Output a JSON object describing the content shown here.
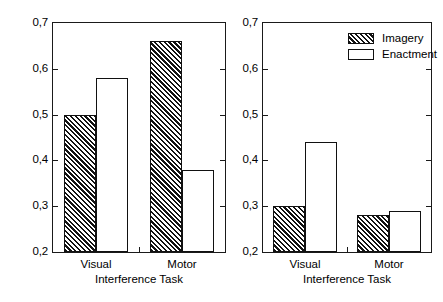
{
  "figure": {
    "panels": [
      {
        "id": "left",
        "ylabel": "Proportion of Recalled Items",
        "xlabel": "Interference Task",
        "show_ylabel": true
      },
      {
        "id": "right",
        "ylabel": "Proportion of Recalled Items",
        "xlabel": "Interference Task",
        "show_ylabel": false
      }
    ],
    "legend": {
      "position": "top-right-of-right-panel",
      "entries": [
        {
          "label": "Imagery",
          "fill": "hatched"
        },
        {
          "label": "Enactment",
          "fill": "white"
        }
      ]
    },
    "ytick_labels": [
      "0,2",
      "0,3",
      "0,4",
      "0,5",
      "0,6",
      "0,7"
    ],
    "xtick_labels": [
      "Visual",
      "Motor"
    ],
    "colors": {
      "axis": "#1a1a1a",
      "bar_outline": "#111111",
      "bar_fill_enactment": "#ffffff",
      "background": "#ffffff"
    }
  },
  "chart_data": [
    {
      "type": "bar",
      "panel": "left",
      "title": "",
      "xlabel": "Interference Task",
      "ylabel": "Proportion of Recalled Items",
      "categories": [
        "Visual",
        "Motor"
      ],
      "series": [
        {
          "name": "Imagery",
          "values": [
            0.5,
            0.66
          ]
        },
        {
          "name": "Enactment",
          "values": [
            0.58,
            0.38
          ]
        }
      ],
      "ylim": [
        0.2,
        0.7
      ],
      "yticks": [
        0.2,
        0.3,
        0.4,
        0.5,
        0.6,
        0.7
      ],
      "ytick_labels": [
        "0,2",
        "0,3",
        "0,4",
        "0,5",
        "0,6",
        "0,7"
      ],
      "grid": false,
      "legend": false
    },
    {
      "type": "bar",
      "panel": "right",
      "title": "",
      "xlabel": "Interference Task",
      "ylabel": "Proportion of Recalled Items",
      "categories": [
        "Visual",
        "Motor"
      ],
      "series": [
        {
          "name": "Imagery",
          "values": [
            0.3,
            0.28
          ]
        },
        {
          "name": "Enactment",
          "values": [
            0.44,
            0.29
          ]
        }
      ],
      "ylim": [
        0.2,
        0.7
      ],
      "yticks": [
        0.2,
        0.3,
        0.4,
        0.5,
        0.6,
        0.7
      ],
      "ytick_labels": [
        "0,2",
        "0,3",
        "0,4",
        "0,5",
        "0,6",
        "0,7"
      ],
      "grid": false,
      "legend": true,
      "legend_position": "upper right"
    }
  ]
}
